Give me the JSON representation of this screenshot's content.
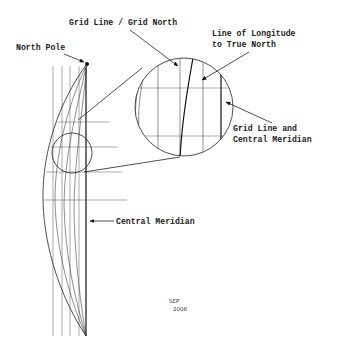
{
  "diagram": {
    "type": "map projection grid convergence",
    "labels": {
      "north_pole": "North Pole",
      "grid_north": "Grid Line / Grid North",
      "longitude_line_1": "Line of Longitude",
      "longitude_line_2": "to True North",
      "grid_central_1": "Grid Line and",
      "grid_central_2": "Central Meridian",
      "central_meridian": "Central Meridian"
    },
    "signature": {
      "initials": "SEP",
      "year": "2008"
    },
    "colors": {
      "line": "#222222",
      "background": "#ffffff"
    }
  }
}
